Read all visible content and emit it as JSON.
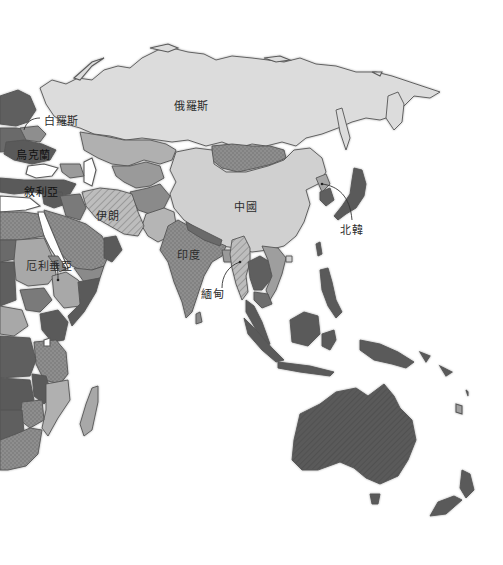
{
  "map": {
    "title": "",
    "style": "greyscale thematic political map",
    "colors": {
      "ocean": "#ffffff",
      "light_grey": "#d9d9d9",
      "mid_grey": "#a9a9a9",
      "dark_grey": "#5e5e5e",
      "dotted_grey": "#8e8e8e",
      "border": "#555555",
      "label_text": "#2b2b2b"
    },
    "fill_patterns": [
      "solid-light",
      "solid-mid",
      "solid-dark",
      "dotted",
      "hatched"
    ],
    "labels": [
      {
        "id": "belarus",
        "text": "白羅斯",
        "x": 44,
        "y": 112,
        "leader_line": true
      },
      {
        "id": "ukraine",
        "text": "烏克蘭",
        "x": 16,
        "y": 146,
        "leader_line": false
      },
      {
        "id": "syria",
        "text": "敘利亞",
        "x": 24,
        "y": 183,
        "leader_line": false
      },
      {
        "id": "russia",
        "text": "俄羅斯",
        "x": 174,
        "y": 97,
        "leader_line": false
      },
      {
        "id": "iran",
        "text": "伊朗",
        "x": 96,
        "y": 213,
        "leader_line": false
      },
      {
        "id": "china",
        "text": "中國",
        "x": 234,
        "y": 199,
        "leader_line": false
      },
      {
        "id": "india",
        "text": "印度",
        "x": 177,
        "y": 246,
        "leader_line": false
      },
      {
        "id": "north-korea",
        "text": "北韓",
        "x": 340,
        "y": 221,
        "leader_line": true
      },
      {
        "id": "myanmar",
        "text": "緬甸",
        "x": 201,
        "y": 285,
        "leader_line": true
      },
      {
        "id": "eritrea",
        "text": "厄利垂亞",
        "x": 26,
        "y": 258,
        "leader_line": true
      }
    ]
  }
}
